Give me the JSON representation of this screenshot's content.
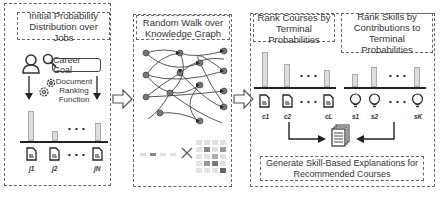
{
  "panels": {
    "jobs": {
      "title": "Initial Probability Distribution over Jobs",
      "title_line1": "Initial Probability",
      "title_line2": "Distribution over Jobs",
      "career_goal_label": "Career Goal",
      "ranking_label_1": "Document",
      "ranking_label_2": "Ranking",
      "ranking_label_3": "Function",
      "items": [
        {
          "label": "j1",
          "bar_height": 30
        },
        {
          "label": "j2",
          "bar_height": 10
        },
        {
          "label": "jN",
          "bar_height": 18
        }
      ],
      "ellipsis": "• • •",
      "icons": [
        "user-icon",
        "search-icon",
        "gear-icon",
        "document-icon"
      ]
    },
    "walk": {
      "title_line1": "Random Walk over",
      "title_line2": "Knowledge Graph",
      "icons": [
        "knowledge-graph",
        "transition-matrix",
        "multiply-icon"
      ]
    },
    "courses": {
      "title_line1": "Rank Courses by",
      "title_line2": "Terminal Probabilities",
      "items": [
        {
          "label": "c1",
          "bar_height": 35
        },
        {
          "label": "c2",
          "bar_height": 23
        },
        {
          "label": "cL",
          "bar_height": 17
        }
      ],
      "ellipsis": "• • •"
    },
    "skills": {
      "title_line1": "Rank Skills by",
      "title_line2": "Contributions to",
      "title_line3": "Terminal Probabilities",
      "items": [
        {
          "label": "s1",
          "bar_height": 13
        },
        {
          "label": "s2",
          "bar_height": 20
        },
        {
          "label": "sK",
          "bar_height": 20
        }
      ],
      "ellipsis": "• • •"
    },
    "explanations": {
      "line1": "Generate Skill-Based Explanations for",
      "line2": "Recommended Courses"
    }
  },
  "colors": {
    "bar_fill": "#dddddd",
    "bar_stroke": "#aaaaaa",
    "border": "#666666",
    "text": "#333333"
  }
}
